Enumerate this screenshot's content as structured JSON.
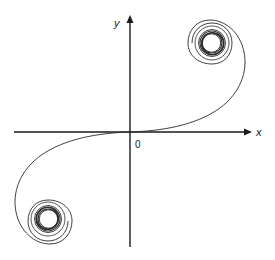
{
  "diagram": {
    "type": "phase-portrait",
    "axes": {
      "x_label": "x",
      "y_label": "y",
      "origin_label": "0"
    },
    "colors": {
      "axis": "#1a1a1a",
      "curve": "#2a2a2a",
      "background": "#ffffff"
    },
    "spirals": [
      {
        "name": "upper-right-spiral",
        "quadrant": "I"
      },
      {
        "name": "lower-left-spiral",
        "quadrant": "III"
      }
    ]
  }
}
